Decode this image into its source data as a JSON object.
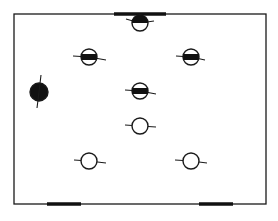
{
  "diagram": {
    "type": "floor-plan-layout",
    "colors": {
      "stroke": "#1a1a1a",
      "fill": "#111111",
      "background": "#ffffff"
    },
    "room": {
      "x": 14,
      "y": 14,
      "width": 252,
      "height": 190
    },
    "wall_segments": [
      {
        "name": "top-center-bar",
        "x1": 114,
        "y1": 14,
        "x2": 166,
        "y2": 14
      },
      {
        "name": "bottom-left-bar",
        "x1": 47,
        "y1": 204,
        "x2": 81,
        "y2": 204
      },
      {
        "name": "bottom-right-bar",
        "x1": 199,
        "y1": 204,
        "x2": 233,
        "y2": 204
      }
    ],
    "figures": [
      {
        "name": "figure-top-center",
        "cx": 140,
        "cy": 23,
        "r": 8,
        "fill": "top-half",
        "arms": [
          [
            126,
            19
          ],
          [
            154,
            21
          ]
        ]
      },
      {
        "name": "figure-row2-left",
        "cx": 89,
        "cy": 57,
        "r": 8,
        "fill": "band",
        "arms": [
          [
            73,
            56
          ],
          [
            106,
            60
          ]
        ]
      },
      {
        "name": "figure-row2-right",
        "cx": 191,
        "cy": 57,
        "r": 8,
        "fill": "band",
        "arms": [
          [
            176,
            56
          ],
          [
            205,
            60
          ]
        ]
      },
      {
        "name": "figure-left-solid",
        "cx": 39,
        "cy": 92,
        "r": 9,
        "fill": "solid",
        "arms": [
          [
            41,
            75
          ],
          [
            37,
            108
          ]
        ]
      },
      {
        "name": "figure-center-banded",
        "cx": 140,
        "cy": 91,
        "r": 8,
        "fill": "band",
        "arms": [
          [
            125,
            90
          ],
          [
            156,
            94
          ]
        ]
      },
      {
        "name": "figure-center-open",
        "cx": 140,
        "cy": 126,
        "r": 8,
        "fill": "none",
        "arms": [
          [
            125,
            125
          ],
          [
            156,
            127
          ]
        ]
      },
      {
        "name": "figure-bottom-left",
        "cx": 89,
        "cy": 161,
        "r": 8,
        "fill": "none",
        "arms": [
          [
            74,
            160
          ],
          [
            106,
            163
          ]
        ]
      },
      {
        "name": "figure-bottom-right",
        "cx": 191,
        "cy": 161,
        "r": 8,
        "fill": "none",
        "arms": [
          [
            175,
            160
          ],
          [
            207,
            163
          ]
        ]
      }
    ]
  }
}
